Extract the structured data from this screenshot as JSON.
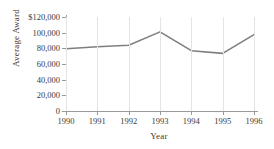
{
  "chart_data": {
    "type": "line",
    "title": "",
    "xlabel": "Year",
    "ylabel": "Average Award",
    "categories": [
      "1990",
      "1991",
      "1992",
      "1993",
      "1994",
      "1995",
      "1996"
    ],
    "values": [
      79500,
      82000,
      84000,
      101000,
      77000,
      73500,
      97500
    ],
    "series": [
      {
        "name": "Average Award",
        "values": [
          79500,
          82000,
          84000,
          101000,
          77000,
          73500,
          97500
        ]
      }
    ],
    "ylim": [
      0,
      120000
    ],
    "yticks": [
      0,
      20000,
      40000,
      60000,
      80000,
      100000,
      120000
    ],
    "ytick_labels": [
      "0",
      "20,000",
      "40,000",
      "60,000",
      "80,000",
      "100,000",
      "$120,000"
    ],
    "xtick_labels": [
      "1990",
      "1991",
      "1992",
      "1993",
      "1994",
      "1995",
      "1996"
    ],
    "grid": "vertical",
    "legend": "none",
    "line_color": "#7f7f7f",
    "grid_color": "#e4e4e4",
    "axis_color": "#9a9a9a"
  }
}
